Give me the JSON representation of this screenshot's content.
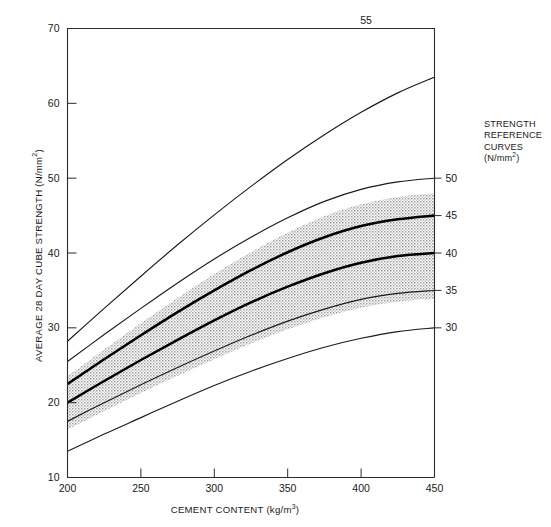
{
  "chart_data": {
    "type": "line",
    "title": "",
    "xlabel": "CEMENT CONTENT (kg/m3)",
    "ylabel": "AVERAGE 28 DAY CUBE STRENGTH (N/mm2)",
    "xlim": [
      200,
      450
    ],
    "ylim": [
      10,
      70
    ],
    "xticks": [
      200,
      250,
      300,
      350,
      400,
      450
    ],
    "yticks": [
      10,
      20,
      30,
      40,
      50,
      60,
      70
    ],
    "grid": false,
    "legend_position": "right-outside",
    "x": [
      200,
      225,
      250,
      275,
      300,
      325,
      350,
      375,
      400,
      425,
      450
    ],
    "series": [
      {
        "name": "30",
        "label": "30",
        "emphasis": "thin",
        "values": [
          13.5,
          15.8,
          18.0,
          20.2,
          22.3,
          24.2,
          25.9,
          27.4,
          28.6,
          29.5,
          30.0
        ]
      },
      {
        "name": "35",
        "label": "35",
        "emphasis": "thin",
        "values": [
          17.5,
          20.0,
          22.4,
          24.7,
          26.9,
          29.0,
          30.9,
          32.5,
          33.8,
          34.6,
          35.0
        ]
      },
      {
        "name": "40",
        "label": "40",
        "emphasis": "thick",
        "values": [
          20.0,
          22.9,
          25.7,
          28.4,
          31.0,
          33.4,
          35.5,
          37.3,
          38.7,
          39.6,
          40.0
        ]
      },
      {
        "name": "45",
        "label": "45",
        "emphasis": "thick",
        "values": [
          22.5,
          25.8,
          29.0,
          32.1,
          35.0,
          37.7,
          40.1,
          42.1,
          43.6,
          44.5,
          45.0
        ]
      },
      {
        "name": "50",
        "label": "50",
        "emphasis": "thin",
        "values": [
          25.5,
          29.1,
          32.6,
          36.0,
          39.2,
          42.1,
          44.7,
          46.9,
          48.5,
          49.5,
          50.0
        ]
      },
      {
        "name": "55",
        "label": "55",
        "emphasis": "thin",
        "values": [
          28.2,
          32.6,
          36.9,
          41.1,
          45.1,
          48.9,
          52.5,
          55.8,
          58.8,
          61.4,
          63.5
        ]
      }
    ],
    "shaded_band": {
      "label": "stippled envelope",
      "color": "#b6b6b6",
      "lower_series": "35",
      "upper_series": "50",
      "lower_offset": -1.1,
      "upper_offset": -2.0
    },
    "annotations": [
      {
        "text": "55",
        "near_series": "55",
        "position": "above-top-axis"
      }
    ]
  },
  "axes": {
    "x": {
      "title_main": "CEMENT CONTENT (kg/m",
      "title_sup": "3",
      "title_tail": ")",
      "tick_labels": [
        "200",
        "250",
        "300",
        "350",
        "400",
        "450"
      ]
    },
    "y": {
      "title_main": "AVERAGE 28 DAY CUBE STRENGTH (N/mm",
      "title_sup": "2",
      "title_tail": ")",
      "tick_labels": [
        "70",
        "60",
        "50",
        "40",
        "30",
        "20",
        "10"
      ]
    }
  },
  "right_axis_labels": [
    "50",
    "45",
    "40",
    "35",
    "30"
  ],
  "top_label": "55",
  "legend": {
    "line1": "STRENGTH",
    "line2": "REFERENCE",
    "line3": "CURVES",
    "line4_main": "(N/mm",
    "line4_sup": "2",
    "line4_tail": ")"
  },
  "colors": {
    "background": "#ffffff",
    "axis": "#2b2b2b",
    "curve_thin": "#1b1b1b",
    "curve_thick": "#000000",
    "band": "#b6b6b6",
    "text": "#1a1a1a"
  }
}
